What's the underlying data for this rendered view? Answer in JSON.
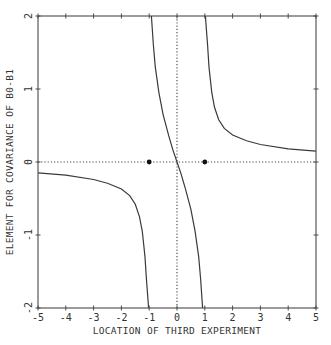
{
  "chart_data": {
    "type": "line",
    "title": "",
    "xlabel": "LOCATION OF THIRD EXPERIMENT",
    "ylabel": "ELEMENT FOR COVARIANCE OF B0-B1",
    "xlim": [
      -5,
      5
    ],
    "ylim": [
      -2,
      2
    ],
    "x_ticks": [
      -5,
      -4,
      -3,
      -2,
      -1,
      0,
      1,
      2,
      3,
      4,
      5
    ],
    "x_tick_labels": [
      "-5",
      "-4",
      "-3",
      "-2",
      "-1",
      "0",
      "1",
      "2",
      "3",
      "4",
      "5"
    ],
    "y_ticks": [
      -2,
      -1,
      0,
      1,
      2
    ],
    "y_tick_labels": [
      "-2",
      "-1",
      "0",
      "1",
      "2"
    ],
    "grid": false,
    "reference_lines": [
      {
        "orientation": "horizontal",
        "value": 0,
        "style": "dotted"
      },
      {
        "orientation": "vertical",
        "value": 0,
        "style": "dotted"
      }
    ],
    "marked_points": [
      {
        "x": -1,
        "y": 0
      },
      {
        "x": 1,
        "y": 0
      }
    ],
    "series": [
      {
        "name": "left branch",
        "x": [
          -5,
          -4,
          -3,
          -2.5,
          -2,
          -1.7,
          -1.5,
          -1.35,
          -1.25,
          -1.15,
          -1.1,
          -1.05,
          -1.02
        ],
        "y": [
          -0.15,
          -0.18,
          -0.24,
          -0.29,
          -0.37,
          -0.46,
          -0.58,
          -0.75,
          -0.95,
          -1.3,
          -1.6,
          -1.85,
          -2.0
        ]
      },
      {
        "name": "middle branch",
        "x": [
          -0.92,
          -0.85,
          -0.78,
          -0.65,
          -0.5,
          -0.3,
          -0.15,
          0,
          0.15,
          0.3,
          0.5,
          0.65,
          0.78,
          0.85,
          0.92
        ],
        "y": [
          2.0,
          1.6,
          1.3,
          0.95,
          0.65,
          0.36,
          0.17,
          0,
          -0.17,
          -0.36,
          -0.65,
          -0.95,
          -1.3,
          -1.6,
          -2.0
        ]
      },
      {
        "name": "right branch",
        "x": [
          1.02,
          1.05,
          1.1,
          1.15,
          1.25,
          1.35,
          1.5,
          1.7,
          2,
          2.5,
          3,
          4,
          5
        ],
        "y": [
          2.0,
          1.85,
          1.6,
          1.3,
          0.95,
          0.75,
          0.58,
          0.46,
          0.37,
          0.29,
          0.24,
          0.18,
          0.15
        ]
      }
    ],
    "colors": {
      "line": "#3a3a3a",
      "axis": "#4a4a4a",
      "background": "#ffffff"
    }
  }
}
